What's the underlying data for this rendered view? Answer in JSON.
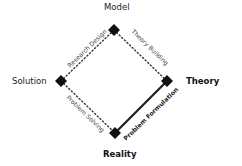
{
  "diagram": {
    "nodes": {
      "top": {
        "label": "Model",
        "bold": false
      },
      "left": {
        "label": "Solution",
        "bold": false
      },
      "right": {
        "label": "Theory",
        "bold": true
      },
      "bottom": {
        "label": "Reality",
        "bold": true
      }
    },
    "edges": {
      "left_top": {
        "label": "Research Design",
        "style": "dotted"
      },
      "top_right": {
        "label": "Theory Building",
        "style": "dotted"
      },
      "left_bottom": {
        "label": "Problem Solving",
        "style": "dotted"
      },
      "bottom_right": {
        "label": "Problem Formulation",
        "style": "solid",
        "bold": true
      }
    },
    "colors": {
      "node": "#111111",
      "edge": "#222222",
      "text": "#222222"
    }
  }
}
